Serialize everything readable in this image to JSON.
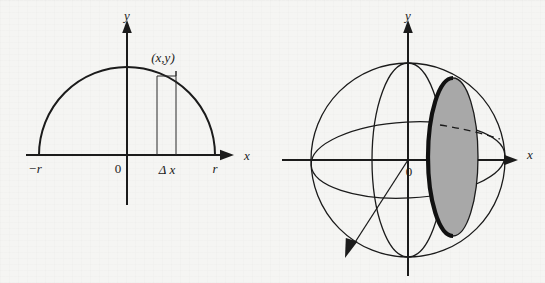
{
  "figure_set": {
    "background_color": "#f5f5f3",
    "ink_color": "#1b1b1b",
    "shade_color": "#a8a8a8"
  },
  "left_figure": {
    "name": "semicircle-with-riemann-strip",
    "axes": {
      "x_axis_label": "x",
      "y_axis_label": "y",
      "origin_label": "0"
    },
    "tick_labels": {
      "left_endpoint": "−r",
      "right_endpoint": "r"
    },
    "annotations": {
      "point_label": "(x,y)",
      "strip_width_label": "Δ x"
    },
    "geometry": {
      "center_x": 127,
      "baseline_y": 155,
      "radius": 88,
      "strip_left_x": 157,
      "strip_right_x": 176,
      "strip_top_y": 71
    }
  },
  "right_figure": {
    "name": "sphere-with-shaded-disk-slice",
    "axes": {
      "x_axis_label": "x",
      "y_axis_label": "y",
      "origin_label": "0"
    },
    "geometry": {
      "center_x": 136,
      "center_y": 160,
      "radius": 97,
      "equator_semi_minor": 38,
      "meridian_semi_minor": 36,
      "disk_center_x": 453,
      "disk_semi_major_y": 79,
      "disk_semi_minor_x": 25
    },
    "elements": [
      "outer-circle",
      "equator-ellipse",
      "vertical-meridian-ellipse",
      "shaded-disk",
      "disk-rim",
      "dashed-hidden-arc",
      "z-axis-arrow"
    ]
  }
}
